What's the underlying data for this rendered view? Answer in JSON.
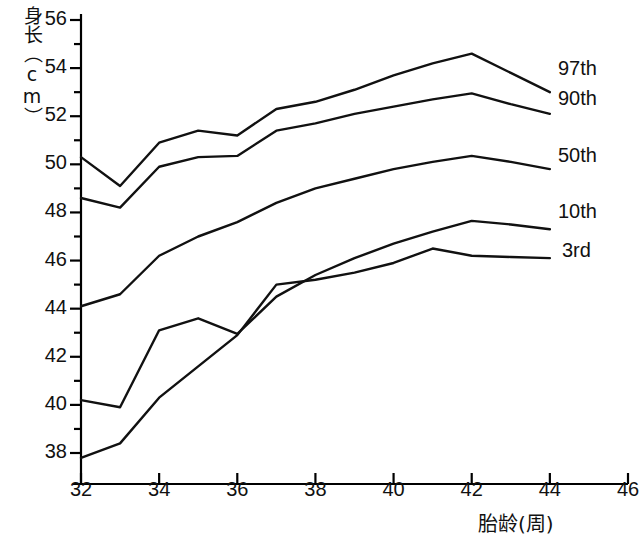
{
  "chart_data": {
    "type": "line",
    "title": "",
    "xlabel": "胎龄(周)",
    "ylabel": "身长（cm）",
    "xlim": [
      32,
      46
    ],
    "ylim": [
      36.8,
      56
    ],
    "xticks": [
      32,
      34,
      36,
      38,
      40,
      42,
      44,
      46
    ],
    "yticks": [
      38,
      40,
      42,
      44,
      46,
      48,
      50,
      52,
      54,
      56
    ],
    "x_minor_step": 1,
    "y_minor_step": 1,
    "grid": false,
    "legend_position": "right-inline-end-of-line",
    "x": [
      32,
      33,
      34,
      35,
      36,
      37,
      38,
      39,
      40,
      41,
      42,
      43,
      44
    ],
    "series": [
      {
        "name": "97th",
        "values": [
          50.3,
          49.1,
          50.9,
          51.4,
          51.2,
          52.3,
          52.6,
          53.1,
          53.7,
          54.2,
          54.6,
          53.8,
          53.0
        ]
      },
      {
        "name": "90th",
        "values": [
          48.6,
          48.2,
          49.9,
          50.3,
          50.35,
          51.4,
          51.7,
          52.1,
          52.4,
          52.7,
          52.95,
          52.5,
          52.1
        ]
      },
      {
        "name": "50th",
        "values": [
          44.1,
          44.6,
          46.2,
          47.0,
          47.6,
          48.4,
          49.0,
          49.4,
          49.8,
          50.1,
          50.35,
          50.1,
          49.8
        ]
      },
      {
        "name": "10th",
        "values": [
          40.2,
          39.9,
          43.1,
          43.6,
          42.95,
          44.5,
          45.4,
          46.1,
          46.7,
          47.2,
          47.65,
          47.5,
          47.3
        ]
      },
      {
        "name": "3rd",
        "values": [
          37.8,
          38.4,
          40.3,
          41.6,
          42.9,
          45.0,
          45.2,
          45.5,
          45.9,
          46.5,
          46.2,
          46.15,
          46.1
        ]
      }
    ],
    "series_label_positions": [
      {
        "name": "97th",
        "x_px": 558,
        "y_px": 70
      },
      {
        "name": "90th",
        "x_px": 558,
        "y_px": 100
      },
      {
        "name": "50th",
        "x_px": 558,
        "y_px": 157
      },
      {
        "name": "10th",
        "x_px": 558,
        "y_px": 213
      },
      {
        "name": "3rd",
        "x_px": 562,
        "y_px": 252
      }
    ],
    "axis_color": "#000000",
    "line_color": "#111111"
  }
}
